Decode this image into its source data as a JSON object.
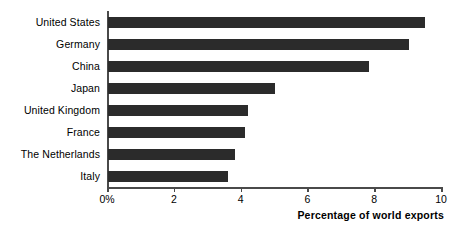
{
  "chart_data": {
    "type": "bar",
    "orientation": "horizontal",
    "title": "",
    "xlabel": "Percentage of world exports",
    "ylabel": "",
    "categories": [
      "United States",
      "Germany",
      "China",
      "Japan",
      "United Kingdom",
      "France",
      "The Netherlands",
      "Italy"
    ],
    "values": [
      9.5,
      9.0,
      7.8,
      5.0,
      4.2,
      4.1,
      3.8,
      3.6
    ],
    "xlim": [
      0,
      10
    ],
    "xticks": [
      0,
      2,
      4,
      6,
      8,
      10
    ],
    "xtick_labels": [
      "0%",
      "2",
      "4",
      "6",
      "8",
      "10"
    ],
    "grid": false,
    "legend": false,
    "bar_color": "#2b2b2b",
    "axis_color": "#4a4a4a",
    "background": "#ffffff"
  }
}
